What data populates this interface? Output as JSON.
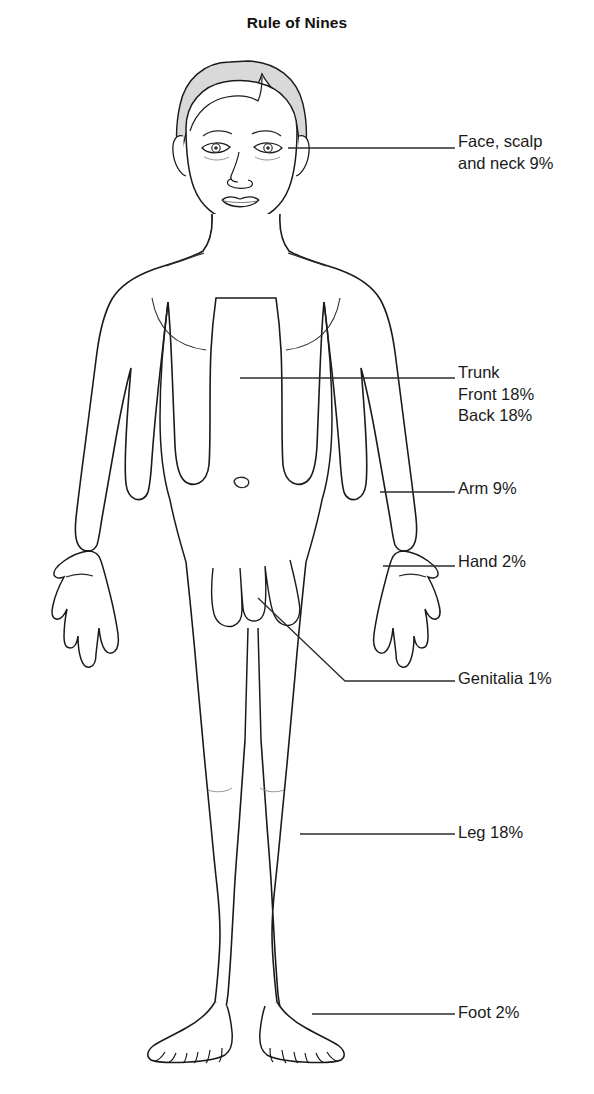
{
  "title": "Rule of Nines",
  "figure": {
    "view": "anterior",
    "skin_fill": "#ffffff",
    "outline_color": "#1a1a1a",
    "hair_fill": "#d9d9d9"
  },
  "colors": {
    "background": "#ffffff",
    "ink": "#1a1a1a",
    "leader": "#2b2b2b",
    "hair": "#d9d9d9"
  },
  "labels": [
    {
      "name": "face-scalp-neck",
      "lines": [
        "Face, scalp",
        "and neck 9%"
      ],
      "region": "Face, scalp and neck",
      "percent": 9,
      "x": 458,
      "y": 131
    },
    {
      "name": "trunk",
      "lines": [
        "Trunk",
        "Front 18%",
        "Back 18%"
      ],
      "region": "Trunk",
      "percent_front": 18,
      "percent_back": 18,
      "x": 458,
      "y": 362
    },
    {
      "name": "arm",
      "lines": [
        "Arm 9%"
      ],
      "region": "Arm",
      "percent": 9,
      "x": 458,
      "y": 478
    },
    {
      "name": "hand",
      "lines": [
        "Hand 2%"
      ],
      "region": "Hand",
      "percent": 2,
      "x": 458,
      "y": 551
    },
    {
      "name": "genitalia",
      "lines": [
        "Genitalia 1%"
      ],
      "region": "Genitalia",
      "percent": 1,
      "x": 458,
      "y": 668
    },
    {
      "name": "leg",
      "lines": [
        "Leg 18%"
      ],
      "region": "Leg",
      "percent": 18,
      "x": 458,
      "y": 822
    },
    {
      "name": "foot",
      "lines": [
        "Foot 2%"
      ],
      "region": "Foot",
      "percent": 2,
      "x": 458,
      "y": 1002
    }
  ]
}
